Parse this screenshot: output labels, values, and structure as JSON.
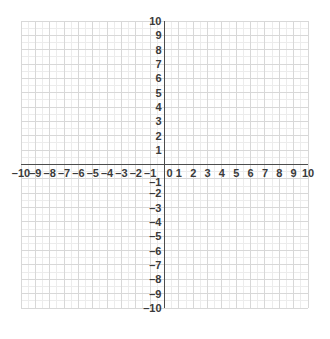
{
  "chart_data": {
    "type": "scatter",
    "title": "",
    "subtitle": "",
    "xlabel": "",
    "ylabel": "",
    "xlim": [
      -10,
      10
    ],
    "ylim": [
      -10,
      10
    ],
    "grid": true,
    "minor_grid": true,
    "minor_subdivisions": 2,
    "legend": null,
    "series": [],
    "x_tick_labels": [
      "–10",
      "–9",
      "–8",
      "–7",
      "–6",
      "–5",
      "–4",
      "–3",
      "–2",
      "–1",
      "0",
      "1",
      "2",
      "3",
      "4",
      "5",
      "6",
      "7",
      "8",
      "9",
      "10"
    ],
    "x_tick_values": [
      -10,
      -9,
      -8,
      -7,
      -6,
      -5,
      -4,
      -3,
      -2,
      -1,
      0,
      1,
      2,
      3,
      4,
      5,
      6,
      7,
      8,
      9,
      10
    ],
    "y_tick_labels": [
      "10",
      "9",
      "8",
      "7",
      "6",
      "5",
      "4",
      "3",
      "2",
      "1",
      "–1",
      "–2",
      "–3",
      "–4",
      "–5",
      "–6",
      "–7",
      "–8",
      "–9",
      "–10"
    ],
    "y_tick_values": [
      10,
      9,
      8,
      7,
      6,
      5,
      4,
      3,
      2,
      1,
      -1,
      -2,
      -3,
      -4,
      -5,
      -6,
      -7,
      -8,
      -9,
      -10
    ]
  },
  "style": {
    "background": "#ffffff",
    "major_grid_color": "#d8d8d8",
    "minor_grid_color": "#ececec",
    "axis_color": "#4d4d4d",
    "label_color": "#3a3a3a"
  }
}
